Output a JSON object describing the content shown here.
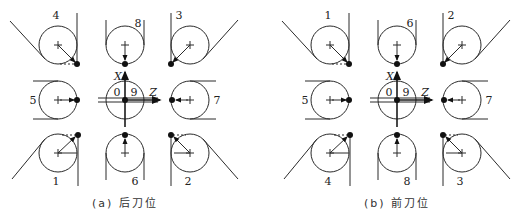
{
  "diagrams": [
    {
      "id": "a",
      "caption": "(a) 后刀位",
      "offset_x": 0,
      "labels": {
        "top_left": "4",
        "top_mid": "8",
        "top_right": "3",
        "mid_left": "5",
        "center_left": "0",
        "center_right": "9",
        "mid_right": "7",
        "bot_left": "1",
        "bot_mid": "6",
        "bot_right": "2"
      },
      "axes": {
        "x": "X",
        "z": "Z"
      }
    },
    {
      "id": "b",
      "caption": "(b) 前刀位",
      "offset_x": 272,
      "labels": {
        "top_left": "1",
        "top_mid": "6",
        "top_right": "2",
        "mid_left": "5",
        "center_left": "0",
        "center_right": "9",
        "mid_right": "7",
        "bot_left": "4",
        "bot_mid": "8",
        "bot_right": "3"
      },
      "axes": {
        "x": "X",
        "z": "Z"
      }
    }
  ]
}
